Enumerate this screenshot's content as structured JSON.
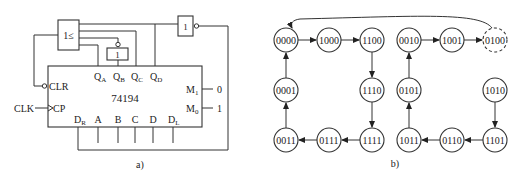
{
  "circuit": {
    "caption": "a)",
    "chip_label": "74194",
    "or_gate_label": "1≤",
    "not_gate_label": "1",
    "not_gate_qb_label": "1",
    "outputs": [
      {
        "main": "Q",
        "sub": "A"
      },
      {
        "main": "Q",
        "sub": "B"
      },
      {
        "main": "Q",
        "sub": "C"
      },
      {
        "main": "Q",
        "sub": "D"
      }
    ],
    "clr_label": "CLR",
    "cp_label": "CP",
    "clk_label": "CLK",
    "mode_pins": [
      {
        "main": "M",
        "sub": "1",
        "value": "0"
      },
      {
        "main": "M",
        "sub": "0",
        "value": "1"
      }
    ],
    "inputs": [
      {
        "main": "D",
        "sub": "R"
      },
      {
        "main": "A",
        "sub": ""
      },
      {
        "main": "B",
        "sub": ""
      },
      {
        "main": "C",
        "sub": ""
      },
      {
        "main": "D",
        "sub": ""
      },
      {
        "main": "D",
        "sub": "L"
      }
    ]
  },
  "state_diagram": {
    "caption": "b)",
    "states": [
      {
        "id": "0000",
        "label": "0000",
        "dashed": false
      },
      {
        "id": "1000",
        "label": "1000",
        "dashed": false
      },
      {
        "id": "1100",
        "label": "1100",
        "dashed": false
      },
      {
        "id": "0010",
        "label": "0010",
        "dashed": false
      },
      {
        "id": "1001",
        "label": "1001",
        "dashed": false
      },
      {
        "id": "0100",
        "label": "0100",
        "dashed": true
      },
      {
        "id": "0001",
        "label": "0001",
        "dashed": false
      },
      {
        "id": "1110",
        "label": "1110",
        "dashed": false
      },
      {
        "id": "0101",
        "label": "0101",
        "dashed": false
      },
      {
        "id": "1010",
        "label": "1010",
        "dashed": false
      },
      {
        "id": "0011",
        "label": "0011",
        "dashed": false
      },
      {
        "id": "0111",
        "label": "0111",
        "dashed": false
      },
      {
        "id": "1111",
        "label": "1111",
        "dashed": false
      },
      {
        "id": "1011",
        "label": "1011",
        "dashed": false
      },
      {
        "id": "0110",
        "label": "0110",
        "dashed": false
      },
      {
        "id": "1101",
        "label": "1101",
        "dashed": false
      }
    ],
    "transitions": [
      [
        "0000",
        "1000"
      ],
      [
        "1000",
        "1100"
      ],
      [
        "1100",
        "1110"
      ],
      [
        "1110",
        "1111"
      ],
      [
        "1111",
        "0111"
      ],
      [
        "0111",
        "0011"
      ],
      [
        "0011",
        "0001"
      ],
      [
        "0001",
        "0000"
      ],
      [
        "1010",
        "1101"
      ],
      [
        "1101",
        "0110"
      ],
      [
        "0110",
        "1011"
      ],
      [
        "1011",
        "0101"
      ],
      [
        "0101",
        "0010"
      ],
      [
        "0010",
        "1001"
      ],
      [
        "1001",
        "0100"
      ],
      [
        "0100",
        "0000"
      ]
    ]
  }
}
